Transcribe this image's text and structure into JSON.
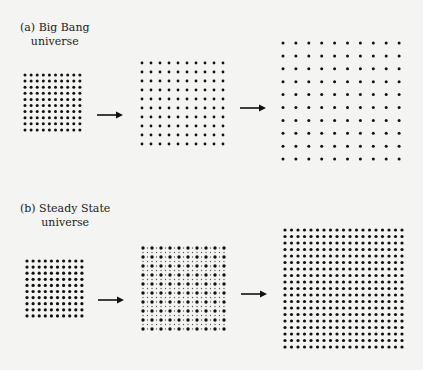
{
  "panel_a": {
    "label_line1": "(a) Big Bang",
    "label_line2": "universe",
    "label_pos": {
      "x": 20,
      "y": 21
    },
    "grids": [
      {
        "x": 25,
        "y": 75,
        "cols": 10,
        "rows": 10,
        "spacing": 6.1,
        "r": 1.5,
        "fill": "#111111"
      },
      {
        "x": 142,
        "y": 63,
        "cols": 10,
        "rows": 10,
        "spacing": 9,
        "r": 1.4,
        "fill": "#111111"
      },
      {
        "x": 283,
        "y": 43,
        "cols": 10,
        "rows": 10,
        "spacing": 12.9,
        "r": 1.5,
        "fill": "#111111"
      }
    ],
    "arrows": [
      {
        "x": 97,
        "y": 115,
        "len": 26
      },
      {
        "x": 240,
        "y": 108,
        "len": 26
      }
    ]
  },
  "panel_b": {
    "label_line1": "(b) Steady State",
    "label_line2": "universe",
    "label_pos": {
      "x": 20,
      "y": 202
    },
    "grids": [
      {
        "x": 27,
        "y": 261,
        "cols": 10,
        "rows": 10,
        "spacing": 6.1,
        "r": 1.6,
        "fill": "#111111"
      },
      {
        "x": 143,
        "y": 248,
        "cols": 10,
        "rows": 10,
        "spacing": 9,
        "r": 1.7,
        "fill": "#111111",
        "interleave": {
          "r": 0.7,
          "fill": "#555555"
        }
      },
      {
        "x": 285,
        "y": 230,
        "cols": 19,
        "rows": 19,
        "spacing": 6.5,
        "r": 1.6,
        "fill": "#111111"
      }
    ],
    "arrows": [
      {
        "x": 98,
        "y": 300,
        "len": 26
      },
      {
        "x": 241,
        "y": 294,
        "len": 26
      }
    ]
  }
}
